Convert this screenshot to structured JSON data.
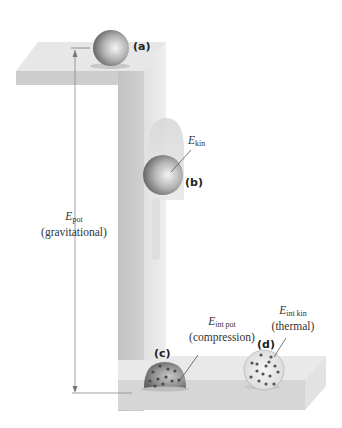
{
  "diagram": {
    "labels": {
      "a": "(a)",
      "b": "(b)",
      "c": "(c)",
      "d": "(d)"
    },
    "energy_labels": {
      "pot": {
        "symbol": "E",
        "subscript": "pot",
        "description": "(gravitational)"
      },
      "kin": {
        "symbol": "E",
        "subscript": "kin"
      },
      "int_pot": {
        "symbol": "E",
        "subscript": "int pot",
        "description": "(compression)"
      },
      "int_kin": {
        "symbol": "E",
        "subscript": "int kin",
        "description": "(thermal)"
      }
    },
    "colors": {
      "platform_top": "#e6e6e6",
      "platform_front": "#cfcfcf",
      "pillar_front": "#c9c9c9",
      "pillar_side": "#e2e2e2",
      "ball_dark": "#6f6f6f",
      "ball_light": "#f2f2f2",
      "dot": "#555555",
      "arrow": "#777777"
    }
  }
}
